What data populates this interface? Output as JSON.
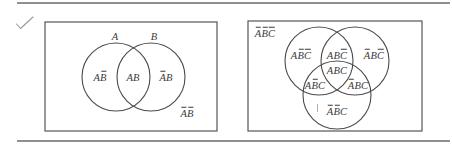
{
  "figure": {
    "colors": {
      "line": "#555555",
      "text": "#3a3a3a",
      "background": "#ffffff"
    },
    "check_mark_icon": "check-mark-icon",
    "two_set_diagram": {
      "set_labels": [
        {
          "name": "A",
          "text": "A"
        },
        {
          "name": "B",
          "text": "B"
        }
      ],
      "regions": [
        {
          "name": "A-only",
          "letters": [
            {
              "c": "A",
              "bar": false
            },
            {
              "c": "B",
              "bar": true
            }
          ]
        },
        {
          "name": "A-and-B",
          "letters": [
            {
              "c": "A",
              "bar": false
            },
            {
              "c": "B",
              "bar": false
            }
          ]
        },
        {
          "name": "B-only",
          "letters": [
            {
              "c": "A",
              "bar": true
            },
            {
              "c": "B",
              "bar": false
            }
          ]
        },
        {
          "name": "neither",
          "letters": [
            {
              "c": "A",
              "bar": true
            },
            {
              "c": "B",
              "bar": true
            }
          ]
        }
      ]
    },
    "three_set_diagram": {
      "regions": [
        {
          "name": "none",
          "letters": [
            {
              "c": "A",
              "bar": true
            },
            {
              "c": "B",
              "bar": true
            },
            {
              "c": "C",
              "bar": true
            }
          ]
        },
        {
          "name": "A-only",
          "letters": [
            {
              "c": "A",
              "bar": false
            },
            {
              "c": "B",
              "bar": true
            },
            {
              "c": "C",
              "bar": true
            }
          ]
        },
        {
          "name": "A-and-B-only",
          "letters": [
            {
              "c": "A",
              "bar": false
            },
            {
              "c": "B",
              "bar": false
            },
            {
              "c": "C",
              "bar": true
            }
          ]
        },
        {
          "name": "B-only",
          "letters": [
            {
              "c": "A",
              "bar": true
            },
            {
              "c": "B",
              "bar": false
            },
            {
              "c": "C",
              "bar": true
            }
          ]
        },
        {
          "name": "A-B-C",
          "letters": [
            {
              "c": "A",
              "bar": false
            },
            {
              "c": "B",
              "bar": false
            },
            {
              "c": "C",
              "bar": false
            }
          ]
        },
        {
          "name": "A-and-C-only",
          "letters": [
            {
              "c": "A",
              "bar": false
            },
            {
              "c": "B",
              "bar": true
            },
            {
              "c": "C",
              "bar": false
            }
          ]
        },
        {
          "name": "B-and-C-only",
          "letters": [
            {
              "c": "A",
              "bar": true
            },
            {
              "c": "B",
              "bar": false
            },
            {
              "c": "C",
              "bar": false
            }
          ]
        },
        {
          "name": "C-only",
          "letters": [
            {
              "c": "A",
              "bar": true
            },
            {
              "c": "B",
              "bar": true
            },
            {
              "c": "C",
              "bar": false
            }
          ]
        }
      ]
    }
  }
}
